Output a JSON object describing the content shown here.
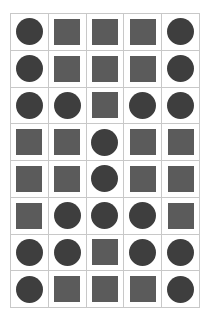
{
  "grid": {
    "rows": 8,
    "columns": 5,
    "colors": {
      "circle": "#3e3e3e",
      "square": "#5b5b5b",
      "line": "#c8c8c8",
      "background": "#ffffff"
    },
    "cells": [
      [
        "circle",
        "square",
        "square",
        "square",
        "circle"
      ],
      [
        "circle",
        "square",
        "square",
        "square",
        "circle"
      ],
      [
        "circle",
        "circle",
        "square",
        "circle",
        "circle"
      ],
      [
        "square",
        "square",
        "circle",
        "square",
        "square"
      ],
      [
        "square",
        "square",
        "circle",
        "square",
        "square"
      ],
      [
        "square",
        "circle",
        "circle",
        "circle",
        "square"
      ],
      [
        "circle",
        "circle",
        "square",
        "circle",
        "circle"
      ],
      [
        "circle",
        "square",
        "square",
        "square",
        "circle"
      ]
    ]
  }
}
